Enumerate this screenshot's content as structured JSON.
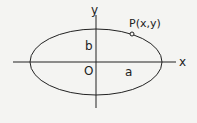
{
  "diagram": {
    "type": "ellipse-on-axes",
    "labels": {
      "x_axis": "x",
      "y_axis": "y",
      "origin": "O",
      "semi_major": "a",
      "semi_minor": "b",
      "point": "P(x,y)"
    },
    "colors": {
      "stroke": "#222222",
      "background": "#f4f4f2"
    }
  }
}
